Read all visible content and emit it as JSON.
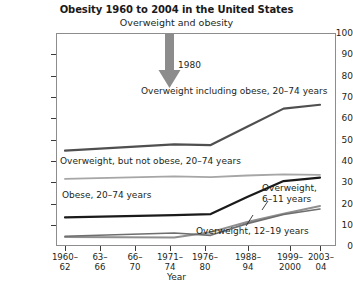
{
  "chart_data": {
    "type": "line",
    "title": "Obesity 1960 to 2004 in the United States",
    "subtitle": "Overweight and obesity",
    "xlabel": "Year",
    "ylabel": "Percent",
    "ylim": [
      0,
      100
    ],
    "yticks": [
      0,
      10,
      20,
      30,
      40,
      50,
      60,
      70,
      80,
      90,
      100
    ],
    "grid": false,
    "legend_position": "inline-annotations",
    "categories": [
      "1960–62",
      "63–66",
      "66–70",
      "1971–74",
      "1976–80",
      "1988–94",
      "1999–2000",
      "2003–04"
    ],
    "series": [
      {
        "name": "Overweight including obese, 20–74 years",
        "color": "#4f4f4f",
        "width": 2.2,
        "values": [
          44.8,
          null,
          null,
          47.7,
          47.4,
          56.0,
          64.5,
          66.3
        ]
      },
      {
        "name": "Overweight, but not obese, 20–74 years",
        "color": "#a6a6a6",
        "width": 1.8,
        "values": [
          31.5,
          null,
          null,
          32.7,
          32.3,
          33.1,
          33.6,
          33.4
        ]
      },
      {
        "name": "Obese, 20–74 years",
        "color": "#1a1a1a",
        "width": 2.2,
        "values": [
          13.4,
          null,
          null,
          14.5,
          15.0,
          23.0,
          30.5,
          32.1
        ]
      },
      {
        "name": "Overweight, 6–11 years",
        "color": "#8f8f8f",
        "width": 2.0,
        "values": [
          4.2,
          null,
          null,
          4.0,
          6.5,
          11.3,
          15.1,
          18.8
        ]
      },
      {
        "name": "Overweight, 12–19 years",
        "color": "#6e6e6e",
        "width": 1.6,
        "values": [
          4.6,
          null,
          null,
          6.1,
          5.0,
          10.5,
          14.8,
          17.4
        ]
      }
    ],
    "annotations": [
      {
        "id": "arrow-1980",
        "label": "1980",
        "type": "down-arrow",
        "color": "#8c8c8c",
        "x_category": "1976–80"
      },
      {
        "id": "label-overweight-including-obese",
        "label": "Overweight including obese, 20–74 years"
      },
      {
        "id": "label-overweight-not-obese",
        "label": "Overweight, but not obese, 20–74 years"
      },
      {
        "id": "label-obese",
        "label": "Obese, 20–74 years"
      },
      {
        "id": "label-overweight-6-11",
        "label_line1": "Overweight,",
        "label_line2": "6–11 years"
      },
      {
        "id": "label-overweight-12-19",
        "label": "Overweight, 12–19 years"
      }
    ]
  },
  "axis": {
    "y_tick_0": "0",
    "y_tick_10": "10",
    "y_tick_20": "20",
    "y_tick_30": "30",
    "y_tick_40": "40",
    "y_tick_50": "50",
    "y_tick_60": "60",
    "y_tick_70": "70",
    "y_tick_80": "80",
    "y_tick_90": "90",
    "y_tick_100": "100",
    "x_tick_0_a": "1960–",
    "x_tick_0_b": "62",
    "x_tick_1_a": "63–",
    "x_tick_1_b": "66",
    "x_tick_2_a": "66–",
    "x_tick_2_b": "70",
    "x_tick_3_a": "1971–",
    "x_tick_3_b": "74",
    "x_tick_4_a": "1976–",
    "x_tick_4_b": "80",
    "x_tick_5_a": "1988–",
    "x_tick_5_b": "94",
    "x_tick_6_a": "1999–",
    "x_tick_6_b": "2000",
    "x_tick_7_a": "2003–",
    "x_tick_7_b": "04"
  }
}
